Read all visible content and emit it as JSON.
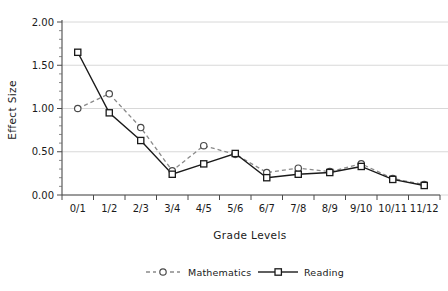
{
  "chart_data": {
    "type": "line",
    "title": "",
    "xlabel": "Grade Levels",
    "ylabel": "Effect Size",
    "categories": [
      "0/1",
      "1/2",
      "2/3",
      "3/4",
      "4/5",
      "5/6",
      "6/7",
      "7/8",
      "8/9",
      "9/10",
      "10/11",
      "11/12"
    ],
    "series": [
      {
        "name": "Mathematics",
        "marker": "open-circle",
        "linestyle": "dashed",
        "color": "#8a8a8a",
        "values": [
          1.0,
          1.17,
          0.78,
          0.28,
          0.57,
          0.47,
          0.26,
          0.31,
          0.27,
          0.36,
          0.19,
          0.12
        ]
      },
      {
        "name": "Reading",
        "marker": "open-square",
        "linestyle": "solid",
        "color": "#1a1a1a",
        "values": [
          1.65,
          0.95,
          0.63,
          0.24,
          0.36,
          0.48,
          0.2,
          0.24,
          0.26,
          0.33,
          0.18,
          0.11
        ]
      }
    ],
    "ylim": [
      0.0,
      2.0
    ],
    "yticks": [
      0.0,
      0.5,
      1.0,
      1.5,
      2.0
    ],
    "ytick_labels": [
      "0.00",
      "0.50",
      "1.00",
      "1.50",
      "2.00"
    ],
    "grid": true,
    "grid_axis": "y",
    "legend_position": "bottom-center"
  },
  "axes": {
    "ylabel": "Effect Size",
    "xlabel": "Grade Levels"
  },
  "legend": {
    "entries": [
      {
        "label": "Mathematics"
      },
      {
        "label": "Reading"
      }
    ]
  }
}
